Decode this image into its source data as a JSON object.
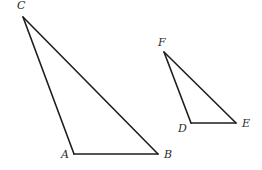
{
  "figure": {
    "width": 262,
    "height": 170,
    "background": "#ffffff",
    "stroke_color": "#1e1e1e",
    "base_edge_color": "#2f4a2f",
    "triangles": [
      {
        "name": "ABC",
        "vertices": {
          "A": {
            "x": 74,
            "y": 154,
            "label": "A",
            "label_x": 61,
            "label_y": 158
          },
          "B": {
            "x": 158,
            "y": 154,
            "label": "B",
            "label_x": 164,
            "label_y": 158
          },
          "C": {
            "x": 23,
            "y": 17,
            "label": "C",
            "label_x": 17,
            "label_y": 9
          }
        }
      },
      {
        "name": "DEF",
        "vertices": {
          "D": {
            "x": 191,
            "y": 123,
            "label": "D",
            "label_x": 178,
            "label_y": 132
          },
          "E": {
            "x": 236,
            "y": 123,
            "label": "E",
            "label_x": 242,
            "label_y": 127
          },
          "F": {
            "x": 164,
            "y": 52,
            "label": "F",
            "label_x": 158,
            "label_y": 46
          }
        }
      }
    ]
  }
}
